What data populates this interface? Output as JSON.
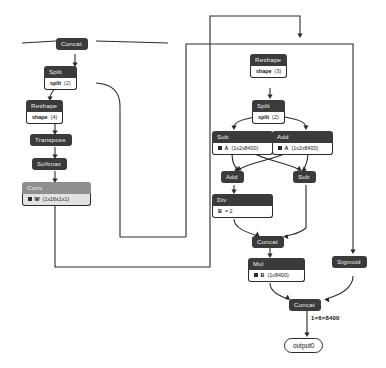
{
  "graph": {
    "type": "onnx-model-graph",
    "title": "",
    "theme": {
      "node_header_bg": "#3b3b3b",
      "node_header_text": "#f2f2f2",
      "node_attr_bg": "#ffffff",
      "node_attr_text": "#111111",
      "conv_header_bg": "#8f8f8f",
      "conv_attr_bg": "#e2e2e2",
      "edge_color": "#2b2b2b",
      "canvas_bg": "#ffffff"
    },
    "nodes": [
      {
        "id": "concat_top",
        "label": "Concat",
        "attr_key": "",
        "attr_val": ""
      },
      {
        "id": "split_left",
        "label": "Split",
        "attr_key": "split",
        "attr_val": "(2)"
      },
      {
        "id": "reshape_left",
        "label": "Reshape",
        "attr_key": "shape",
        "attr_val": "(4)"
      },
      {
        "id": "transpose",
        "label": "Transpose",
        "attr_key": "",
        "attr_val": ""
      },
      {
        "id": "softmax",
        "label": "Softmax",
        "attr_key": "",
        "attr_val": ""
      },
      {
        "id": "conv",
        "label": "Conv",
        "attr_key": "W",
        "attr_val": "(1x16x1x1)"
      },
      {
        "id": "reshape_right",
        "label": "Reshape",
        "attr_key": "shape",
        "attr_val": "(3)"
      },
      {
        "id": "split_right",
        "label": "Split",
        "attr_key": "split",
        "attr_val": "(2)"
      },
      {
        "id": "sub_a",
        "label": "Sub",
        "attr_key": "A",
        "attr_val": "(1x2x8400)"
      },
      {
        "id": "add_a",
        "label": "Add",
        "attr_key": "A",
        "attr_val": "(1x2x8400)"
      },
      {
        "id": "add_b",
        "label": "Add",
        "attr_key": "",
        "attr_val": ""
      },
      {
        "id": "sub_b",
        "label": "Sub",
        "attr_key": "",
        "attr_val": ""
      },
      {
        "id": "div",
        "label": "Div",
        "attr_key": "B",
        "attr_val": "= 2"
      },
      {
        "id": "concat_mid",
        "label": "Concat",
        "attr_key": "",
        "attr_val": ""
      },
      {
        "id": "mul",
        "label": "Mul",
        "attr_key": "B",
        "attr_val": "(1x8400)"
      },
      {
        "id": "sigmoid",
        "label": "Sigmoid",
        "attr_key": "",
        "attr_val": ""
      },
      {
        "id": "concat_out",
        "label": "Concat",
        "attr_key": "",
        "attr_val": ""
      }
    ],
    "output": {
      "label": "output0",
      "edge_label": "1×6×8400"
    }
  }
}
